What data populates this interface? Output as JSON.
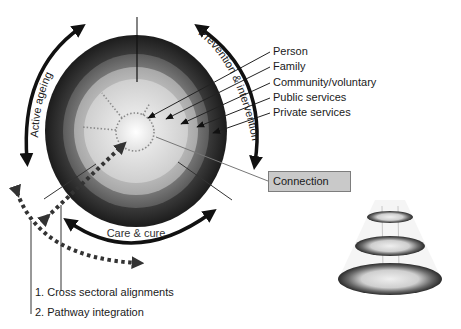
{
  "diagram": {
    "layers": [
      {
        "label": "Person",
        "color": "#f2f2f2"
      },
      {
        "label": "Family",
        "color": "#d9d9d9"
      },
      {
        "label": "Community/voluntary",
        "color": "#bdbdbd"
      },
      {
        "label": "Public services",
        "color": "#7a7a7a"
      },
      {
        "label": "Private services",
        "color": "#2e2e2e"
      }
    ],
    "arc_labels": {
      "left": "Active ageing",
      "right": "Prevention & intervention",
      "bottom": "Care & cure"
    },
    "connection_label": "Connection",
    "integration_labels": [
      "1. Cross sectoral alignments",
      "2. Pathway integration"
    ],
    "icons": {
      "cone": "stacked-ellipse-cone-icon"
    }
  }
}
